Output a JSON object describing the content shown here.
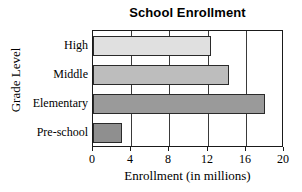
{
  "chart_data": {
    "type": "bar",
    "orientation": "horizontal",
    "title": "School Enrollment",
    "xlabel": "Enrollment (in millions)",
    "ylabel": "Grade Level",
    "categories": [
      "High",
      "Middle",
      "Elementary",
      "Pre-school"
    ],
    "values": [
      12.4,
      14.2,
      18.0,
      3.0
    ],
    "xlim": [
      0,
      20
    ],
    "xticks": [
      0,
      4,
      8,
      12,
      16,
      20
    ],
    "xtick_labels": [
      "0",
      "4",
      "8",
      "12",
      "16",
      "20"
    ],
    "grid": "vertical",
    "legend": "none",
    "bar_colors": [
      "#e0e0e0",
      "#bdbdbd",
      "#9a9a9a",
      "#8f8f8f"
    ],
    "bar_border_color": "#2a2a2a",
    "bars": [
      {
        "category": "High",
        "value": 12.4,
        "color": "#e0e0e0"
      },
      {
        "category": "Middle",
        "value": 14.2,
        "color": "#bdbdbd"
      },
      {
        "category": "Elementary",
        "value": 18.0,
        "color": "#9a9a9a"
      },
      {
        "category": "Pre-school",
        "value": 3.0,
        "color": "#8f8f8f"
      }
    ]
  }
}
